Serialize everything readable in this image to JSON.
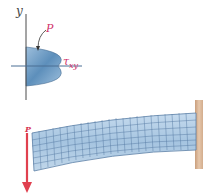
{
  "diagram": {
    "stress_plot": {
      "axis_label_y": "y",
      "load_label": "P",
      "shear_stress_label": "τ",
      "shear_stress_subscript": "xy",
      "distribution_shape": "parabola"
    },
    "beam": {
      "type": "cantilever",
      "load_label": "P",
      "load_direction": "down",
      "support": "fixed-wall-right",
      "mesh": "deformed-grid"
    },
    "colors": {
      "load_arrow": "#e0404f",
      "label_accent": "#d0306a",
      "beam_fill": "#a9c8e3",
      "grid_lines": "#5a7fa6",
      "wall": "#d9b79a",
      "axes": "#4a4a4a"
    }
  }
}
